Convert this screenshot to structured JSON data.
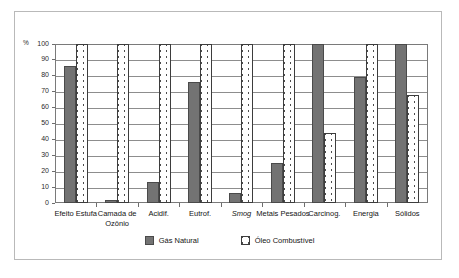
{
  "chart_data": {
    "type": "bar",
    "title": "",
    "subtitle": "",
    "xlabel": "",
    "ylabel": "%",
    "ylim": [
      0,
      100
    ],
    "yticks": [
      0,
      10,
      20,
      30,
      40,
      50,
      60,
      70,
      80,
      90,
      100
    ],
    "ytick_labels": [
      "0",
      "10",
      "20",
      "30",
      "40",
      "50",
      "60",
      "70",
      "80",
      "90",
      "100"
    ],
    "grid": true,
    "legend_position": "bottom",
    "categories": [
      "Efeito Estufa",
      "Camada de Ozônio",
      "Acidif.",
      "Eutrof.",
      "Smog",
      "Metais Pesados",
      "Carcinog.",
      "Energia",
      "Sólidos"
    ],
    "categories_italic": [
      false,
      false,
      false,
      false,
      true,
      false,
      false,
      false,
      false
    ],
    "series": [
      {
        "name": "Gás Natural",
        "color": "#737373",
        "pattern": "solid",
        "values": [
          86,
          2,
          13,
          76,
          6,
          25,
          100,
          79,
          100
        ]
      },
      {
        "name": "Óleo Combustível",
        "color": "#ffffff",
        "pattern": "chevron-hatch",
        "values": [
          100,
          100,
          100,
          100,
          100,
          100,
          44,
          100,
          68
        ]
      }
    ]
  },
  "legend": {
    "items": [
      {
        "label": "Gás Natural",
        "swatch": "solid-gray"
      },
      {
        "label": "Óleo Combustível",
        "swatch": "hatched-white"
      }
    ]
  },
  "colors": {
    "bar_gas": "#737373",
    "bar_gas_border": "#4a4a4a",
    "bar_oleo_fill": "#ffffff",
    "bar_oleo_border": "#3d3d3d",
    "gridline": "#8d8d8d",
    "plot_border": "#7a7a7a",
    "figure_border": "#b9b9b9",
    "text": "#141414",
    "background": "#ffffff"
  }
}
